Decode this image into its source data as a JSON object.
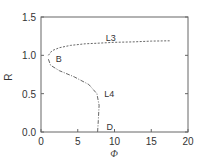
{
  "chart_data": {
    "type": "line",
    "title": "",
    "xlabel": "Φ",
    "ylabel": "R",
    "xlim": [
      0,
      20
    ],
    "ylim": [
      0,
      1.5
    ],
    "xticks": [
      "0",
      "5",
      "10",
      "15",
      "20"
    ],
    "yticks": [
      "0.0",
      "0.5",
      "1.0",
      "1.5"
    ],
    "grid": false,
    "series": [
      {
        "name": "L3",
        "style": "dashed",
        "x": [
          1.0,
          1.5,
          2.5,
          4.0,
          6.0,
          8.0,
          10.0,
          12.5,
          15.0,
          17.5
        ],
        "y": [
          1.0,
          1.06,
          1.1,
          1.13,
          1.15,
          1.16,
          1.17,
          1.175,
          1.185,
          1.19
        ]
      },
      {
        "name": "L4",
        "style": "dash-dot",
        "x": [
          1.0,
          1.3,
          2.5,
          4.5,
          6.5,
          7.6,
          7.9,
          7.8,
          7.7
        ],
        "y": [
          0.95,
          0.87,
          0.8,
          0.72,
          0.62,
          0.5,
          0.35,
          0.15,
          0.0
        ]
      }
    ],
    "annotations": [
      {
        "text": "L3",
        "x": 8.8,
        "y": 1.22
      },
      {
        "text": "B",
        "x": 2.0,
        "y": 0.95
      },
      {
        "text": "L4",
        "x": 8.6,
        "y": 0.49
      },
      {
        "text": "D",
        "x": 8.9,
        "y": 0.06
      }
    ]
  }
}
